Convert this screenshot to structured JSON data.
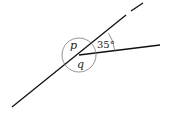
{
  "diagram": {
    "type": "angles-at-a-point",
    "labels": {
      "angle_p": "p",
      "angle_q": "q",
      "known_angle": "35°"
    },
    "colors": {
      "line": "#111111",
      "circle": "#777777",
      "text": "#222222"
    }
  }
}
